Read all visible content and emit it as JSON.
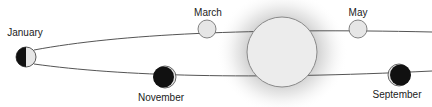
{
  "diagram": {
    "colors": {
      "background": "#ffffff",
      "orbit_line": "#555555",
      "sun_fill": "#ececec",
      "sun_stroke": "#8a8a8a",
      "sun_glow": "#bdbdbd",
      "lit_side": "#e6e6e6",
      "dark_side": "#111111",
      "label": "#222222"
    },
    "sun": {
      "name": "Sun",
      "cx": 282,
      "cy": 52,
      "r": 35
    },
    "positions": [
      {
        "id": "january",
        "label": "January",
        "cx": 26,
        "cy": 57,
        "r": 10,
        "phase": "half-dark-left",
        "label_x": 25,
        "label_y": 28
      },
      {
        "id": "march",
        "label": "March",
        "cx": 207,
        "cy": 29,
        "r": 9,
        "phase": "full-lit",
        "label_x": 208,
        "label_y": 8
      },
      {
        "id": "may",
        "label": "May",
        "cx": 358,
        "cy": 29,
        "r": 9,
        "phase": "full-lit",
        "label_x": 358,
        "label_y": 8
      },
      {
        "id": "november",
        "label": "November",
        "cx": 165,
        "cy": 77,
        "r": 11,
        "phase": "dark-crescent-right",
        "label_x": 161,
        "label_y": 93
      },
      {
        "id": "september",
        "label": "September",
        "cx": 399,
        "cy": 75,
        "r": 11,
        "phase": "dark-crescent-left",
        "label_x": 397,
        "label_y": 90
      }
    ]
  }
}
